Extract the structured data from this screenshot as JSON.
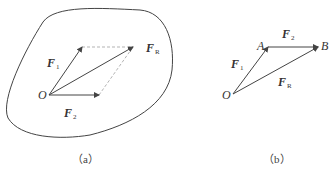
{
  "figure_a": {
    "caption": "（a）",
    "origin": "O",
    "vectors": {
      "f1": {
        "name": "F",
        "sub": "1"
      },
      "f2": {
        "name": "F",
        "sub": "2"
      },
      "fr": {
        "name": "F",
        "sub": "R"
      }
    }
  },
  "figure_b": {
    "caption": "（b）",
    "points": {
      "o": "O",
      "a": "A",
      "b": "B"
    },
    "vectors": {
      "f1": {
        "name": "F",
        "sub": "1"
      },
      "f2": {
        "name": "F",
        "sub": "2"
      },
      "fr": {
        "name": "F",
        "sub": "R"
      }
    }
  },
  "colors": {
    "stroke": "#444444",
    "dashed": "#aaaaaa"
  }
}
